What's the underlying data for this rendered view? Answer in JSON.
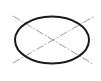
{
  "diagram": {
    "shape": "ellipse",
    "ellipse": {
      "cx": 52,
      "cy": 40,
      "rx": 37,
      "ry": 23.5,
      "stroke": "#1a1a1a",
      "stroke_width": 2
    },
    "center_lines": [
      {
        "x1": 13,
        "y1": 16,
        "x2": 93,
        "y2": 64,
        "stroke": "#9a9a9a",
        "dash": "8 2 1.5 2"
      },
      {
        "x1": 13,
        "y1": 63,
        "x2": 93,
        "y2": 17,
        "stroke": "#9a9a9a",
        "dash": "8 2 1.5 2"
      }
    ]
  }
}
